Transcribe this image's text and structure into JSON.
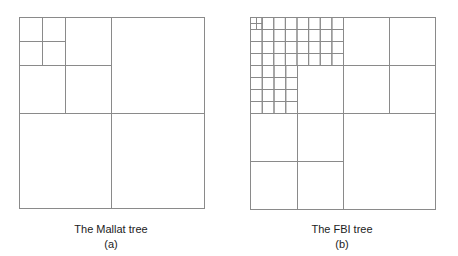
{
  "style": {
    "line_color": "#8a8a8a",
    "line_width": 1,
    "background": "#ffffff"
  },
  "diagrams": [
    {
      "id": "mallat",
      "title": "The Mallat tree",
      "label": "(a)",
      "rects": [
        [
          19,
          17,
          185,
          191
        ],
        [
          19,
          17,
          92,
          96
        ],
        [
          111,
          17,
          93,
          96
        ],
        [
          19,
          113,
          92,
          95
        ],
        [
          111,
          113,
          93,
          95
        ],
        [
          19,
          17,
          46,
          48
        ],
        [
          65,
          17,
          46,
          48
        ],
        [
          19,
          65,
          46,
          48
        ],
        [
          65,
          65,
          46,
          48
        ],
        [
          19,
          17,
          23,
          24
        ],
        [
          42,
          17,
          23,
          24
        ],
        [
          19,
          41,
          23,
          24
        ],
        [
          42,
          41,
          23,
          24
        ]
      ]
    },
    {
      "id": "fbi",
      "title": "The FBI tree",
      "label": "(b)",
      "grid_top": {
        "x": 250,
        "y": 17,
        "cols": 8,
        "rows": 4,
        "cell_w": 11.625,
        "cell_h": 12
      },
      "grid_bl": {
        "x": 250,
        "y": 65,
        "cols": 4,
        "rows": 4,
        "cell_w": 11.75,
        "cell_h": 12
      },
      "rects": [
        [
          250,
          17,
          185,
          192
        ],
        [
          250,
          17,
          93,
          96
        ],
        [
          343,
          17,
          92,
          96
        ],
        [
          250,
          113,
          93,
          96
        ],
        [
          343,
          113,
          92,
          96
        ],
        [
          297,
          65,
          46,
          48
        ],
        [
          343,
          17,
          46,
          48
        ],
        [
          389,
          17,
          46,
          48
        ],
        [
          343,
          65,
          46,
          48
        ],
        [
          389,
          65,
          46,
          48
        ],
        [
          250,
          113,
          47,
          48
        ],
        [
          297,
          113,
          46,
          48
        ],
        [
          250,
          161,
          47,
          48
        ],
        [
          297,
          161,
          46,
          48
        ],
        [
          250,
          17,
          6,
          6
        ],
        [
          256,
          17,
          5.6,
          6
        ],
        [
          250,
          23,
          6,
          6
        ],
        [
          256,
          23,
          5.6,
          6
        ]
      ]
    }
  ]
}
